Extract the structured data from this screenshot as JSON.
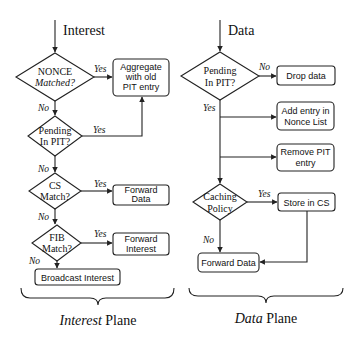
{
  "interest_plane": {
    "entry_label": "Interest",
    "decisions": {
      "nonce": {
        "line1": "NONCE",
        "line2": "Matched?"
      },
      "pending": {
        "line1": "Pending",
        "line2": "In PIT?"
      },
      "cs": {
        "line1": "CS",
        "line2": "Match?"
      },
      "fib": {
        "line1": "FIB",
        "line2": "Match?"
      }
    },
    "actions": {
      "aggregate": {
        "line1": "Aggregate",
        "line2": "with old",
        "line3": "PIT entry"
      },
      "forward_data": {
        "line1": "Forward",
        "line2": "Data"
      },
      "forward_interest": {
        "line1": "Forward",
        "line2": "Interest"
      },
      "broadcast": "Broadcast Interest"
    },
    "edge_labels": {
      "yes": "Yes",
      "no": "No"
    },
    "plane_title": {
      "italic": "Interest",
      "rest": "Plane"
    }
  },
  "data_plane": {
    "entry_label": "Data",
    "decisions": {
      "pending": {
        "line1": "Pending",
        "line2": "In PIT?"
      },
      "caching": {
        "line1": "Caching",
        "line2": "Policy"
      }
    },
    "actions": {
      "drop": "Drop data",
      "add_nonce": {
        "line1": "Add entry in",
        "line2": "Nonce List"
      },
      "remove_pit": {
        "line1": "Remove PIT",
        "line2": "entry"
      },
      "store_cs": "Store in CS",
      "forward_data": "Forward Data"
    },
    "edge_labels": {
      "yes": "Yes",
      "no": "No"
    },
    "plane_title": {
      "italic": "Data",
      "rest": "Plane"
    }
  }
}
